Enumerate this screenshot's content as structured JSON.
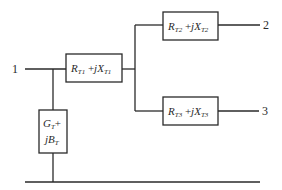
{
  "diagram": {
    "type": "three-winding transformer equivalent circuit",
    "nodes": [
      {
        "id": "1",
        "label": "1"
      },
      {
        "id": "2",
        "label": "2"
      },
      {
        "id": "3",
        "label": "3"
      }
    ],
    "impedances": {
      "t1": {
        "R": "R",
        "R_sub": "T1",
        "plus": " +",
        "jX": "jX",
        "X_sub": "T1"
      },
      "t2": {
        "R": "R",
        "R_sub": "T2",
        "plus": " +",
        "jX": "jX",
        "X_sub": "T2"
      },
      "t3": {
        "R": "R",
        "R_sub": "T3",
        "plus": " +",
        "jX": "jX",
        "X_sub": "T3"
      }
    },
    "shunt": {
      "line1_G": "G",
      "line1_sub": "T",
      "line1_plus": "+",
      "line2_jB": "jB",
      "line2_sub": "T"
    }
  }
}
